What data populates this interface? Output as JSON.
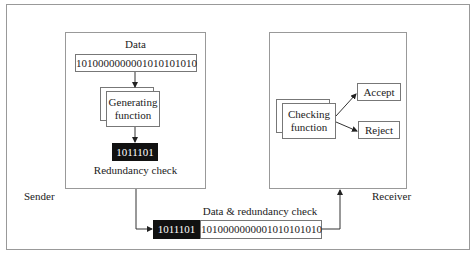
{
  "sender": {
    "label": "Sender",
    "data_label": "Data",
    "data_bits": "1010000000001010101010",
    "generator_line1": "Generating",
    "generator_line2": "function",
    "redundancy_bits": "1011101",
    "redundancy_label": "Redundancy check"
  },
  "channel": {
    "label": "Data & redundancy check",
    "redundancy_bits": "1011101",
    "data_bits": "1010000000001010101010"
  },
  "receiver": {
    "label": "Receiver",
    "checker_line1": "Checking",
    "checker_line2": "function",
    "accept": "Accept",
    "reject": "Reject"
  }
}
